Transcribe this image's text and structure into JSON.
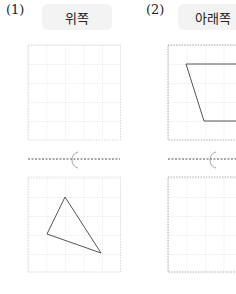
{
  "problems": [
    {
      "number": "(1)",
      "direction": "위쪽"
    },
    {
      "number": "(2)",
      "direction": "아래쪽"
    }
  ],
  "colors": {
    "grid": "#c8c8c8",
    "shape": "#444444",
    "label_bg": "#f3f3f3"
  }
}
